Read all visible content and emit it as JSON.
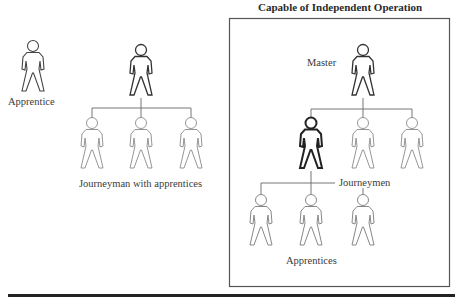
{
  "diagram": {
    "title": "Capable of Independent Operation",
    "labels": {
      "apprentice": "Apprentice",
      "journeyman_group": "Journeyman with apprentices",
      "master": "Master",
      "journeymen": "Journeymen",
      "apprentices": "Apprentices"
    },
    "colors": {
      "stroke_dark": "#333333",
      "stroke_light": "#8a8a8a",
      "box_border": "#555555",
      "rule": "#222222"
    }
  }
}
